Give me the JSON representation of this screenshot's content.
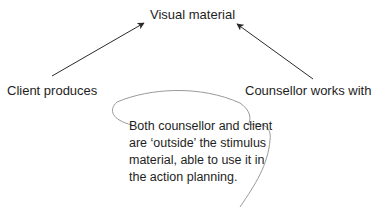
{
  "diagram": {
    "top_node": {
      "label": "Visual material"
    },
    "left_node": {
      "label": "Client produces"
    },
    "right_node": {
      "label": "Counsellor works with"
    },
    "edges": [
      {
        "from": "left_node",
        "to": "top_node",
        "style": "arrow"
      },
      {
        "from": "right_node",
        "to": "top_node",
        "style": "arrow"
      }
    ],
    "note": {
      "lines": [
        "Both counsellor and client",
        "are ‘outside’ the stimulus",
        "material, able to use it in",
        "the action planning."
      ],
      "shape": "hand-drawn-speech-bubble"
    },
    "colors": {
      "text": "#1e1e1e",
      "arrow": "#2b2b2b",
      "bubble_outline": "#9a9a9a",
      "background": "#ffffff"
    }
  }
}
